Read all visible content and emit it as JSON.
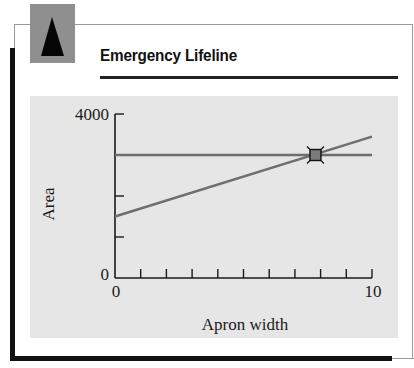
{
  "header": {
    "title": "Emergency Lifeline",
    "icon": "triangle-icon"
  },
  "colors": {
    "icon_box": "#8f8f8f",
    "panel_background": "#e6e6e6",
    "series_lines": "#6e6e6e",
    "marker_fill": "#7a7a7a",
    "axis": "#1a1a1a"
  },
  "chart_data": {
    "type": "line",
    "title": "Emergency Lifeline",
    "xlabel": "Apron width",
    "ylabel": "Area",
    "xlim": [
      0,
      10
    ],
    "ylim": [
      0,
      4000
    ],
    "x_tick_labels": [
      "0",
      "10"
    ],
    "x_minor_ticks": [
      1,
      2,
      3,
      4,
      5,
      6,
      7,
      8,
      9,
      10
    ],
    "y_tick_labels": [
      "0",
      "4000"
    ],
    "y_minor_ticks": [
      1000,
      2000,
      3000,
      4000
    ],
    "grid": false,
    "legend": null,
    "series": [
      {
        "name": "constant area",
        "x": [
          0,
          10
        ],
        "y": [
          3000,
          3000
        ]
      },
      {
        "name": "increasing area",
        "x": [
          0,
          10
        ],
        "y": [
          1500,
          3450
        ]
      }
    ],
    "annotations": [
      {
        "type": "square-marker",
        "label": "intersection",
        "x": 7.8,
        "y": 3000
      }
    ]
  }
}
